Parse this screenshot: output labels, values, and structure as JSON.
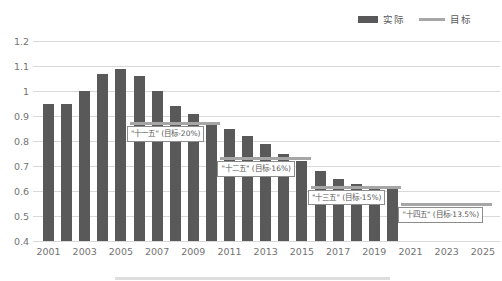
{
  "legend": {
    "actual_label": "实际",
    "target_label": "目标"
  },
  "colors": {
    "bar": "#595959",
    "target_line": "#a6a6a6",
    "gridline": "#d9d9d9",
    "axis_text": "#737373",
    "annotation_text": "#595959",
    "annotation_border": "#8c8c8c"
  },
  "chart_data": {
    "type": "bar",
    "title": "",
    "series_name": "实际",
    "categories": [
      2001,
      2002,
      2003,
      2004,
      2005,
      2006,
      2007,
      2008,
      2009,
      2010,
      2011,
      2012,
      2013,
      2014,
      2015,
      2016,
      2017,
      2018,
      2019,
      2020
    ],
    "values": [
      0.95,
      0.95,
      1.0,
      1.07,
      1.09,
      1.06,
      1.0,
      0.94,
      0.91,
      0.87,
      0.85,
      0.82,
      0.79,
      0.75,
      0.72,
      0.68,
      0.65,
      0.63,
      0.62,
      0.61
    ],
    "x_range": [
      2001,
      2025
    ],
    "x_axis_ticks": [
      "2001",
      "2003",
      "2005",
      "2007",
      "2009",
      "2011",
      "2013",
      "2015",
      "2017",
      "2019",
      "2021",
      "2023",
      "2025"
    ],
    "ylim": [
      0.4,
      1.2
    ],
    "y_ticks": [
      1.2,
      1.1,
      1.0,
      0.9,
      0.8,
      0.7,
      0.6,
      0.5,
      0.4
    ],
    "y_tick_labels": [
      "1.2",
      "1.1",
      "1",
      "0.9",
      "0.8",
      "0.7",
      "0.6",
      "0.5",
      "0.4"
    ],
    "grid": true,
    "legend_position": "top-right",
    "target_segments": [
      {
        "label": "\"十一五\" (目标-20%)",
        "start_year": 2006,
        "end_year": 2010,
        "value": 0.87
      },
      {
        "label": "\"十二五\" (目标-16%)",
        "start_year": 2011,
        "end_year": 2015,
        "value": 0.73
      },
      {
        "label": "\"十三五\" (目标-15%)",
        "start_year": 2016,
        "end_year": 2020,
        "value": 0.615
      },
      {
        "label": "\"十四五\" (目标-13.5%)",
        "start_year": 2021,
        "end_year": 2025,
        "value": 0.545
      }
    ]
  }
}
